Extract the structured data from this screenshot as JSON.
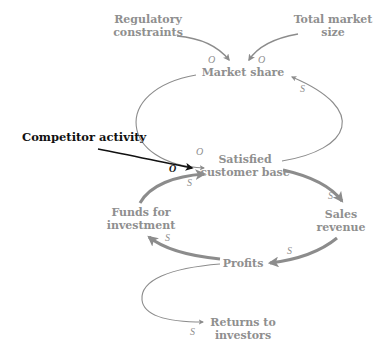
{
  "diagram": {
    "type": "causal-loop",
    "colors": {
      "primary": "#8c8c8c",
      "external": "#111111",
      "background": "#ffffff"
    },
    "nodes": {
      "regulatory": {
        "line1": "Regulatory",
        "line2": "constraints"
      },
      "total_market": {
        "line1": "Total market",
        "line2": "size"
      },
      "market_share": {
        "label": "Market share"
      },
      "competitor": {
        "label": "Competitor activity"
      },
      "satisfied": {
        "line1": "Satisfied",
        "line2": "customer base"
      },
      "funds": {
        "line1": "Funds for",
        "line2": "investment"
      },
      "sales": {
        "line1": "Sales",
        "line2": "revenue"
      },
      "profits": {
        "label": "Profits"
      },
      "returns": {
        "line1": "Returns to",
        "line2": "investors"
      }
    },
    "links": [
      {
        "from": "Regulatory constraints",
        "to": "Market share",
        "polarity": "O"
      },
      {
        "from": "Total market size",
        "to": "Market share",
        "polarity": "O"
      },
      {
        "from": "Market share",
        "to": "Satisfied customer base",
        "polarity": "O"
      },
      {
        "from": "Satisfied customer base",
        "to": "Market share",
        "polarity": "S"
      },
      {
        "from": "Competitor activity",
        "to": "Satisfied customer base",
        "polarity": "O"
      },
      {
        "from": "Funds for investment",
        "to": "Satisfied customer base",
        "polarity": "S"
      },
      {
        "from": "Satisfied customer base",
        "to": "Sales revenue",
        "polarity": "S"
      },
      {
        "from": "Sales revenue",
        "to": "Profits",
        "polarity": "S"
      },
      {
        "from": "Profits",
        "to": "Funds for investment",
        "polarity": "S"
      },
      {
        "from": "Profits",
        "to": "Returns to investors",
        "polarity": "S"
      }
    ],
    "polarity_labels": {
      "reg_ms": "O",
      "tms_ms": "O",
      "ms_scb": "O",
      "scb_ms": "S",
      "comp_scb": "O",
      "funds_scb": "S",
      "scb_sales": "S",
      "sales_profits": "S",
      "profits_funds": "S",
      "profits_returns": "S"
    }
  }
}
